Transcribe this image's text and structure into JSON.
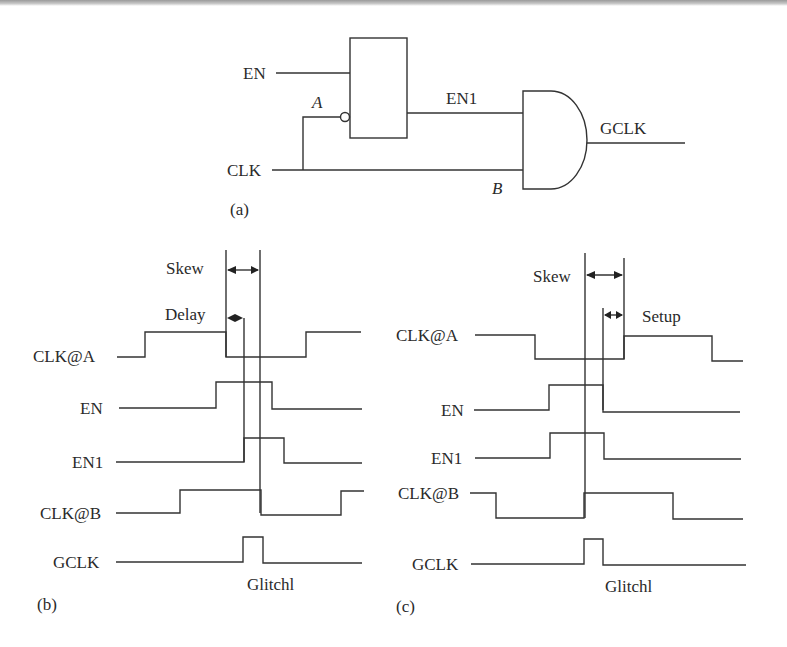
{
  "panel_a": {
    "caption": "(a)",
    "labels": {
      "en": "EN",
      "clk": "CLK",
      "en1": "EN1",
      "gclk": "GCLK",
      "node_a": "A",
      "node_b": "B"
    },
    "components": [
      "latch (active-low clock input)",
      "AND gate"
    ]
  },
  "panel_b": {
    "caption": "(b)",
    "signals": [
      "CLK@A",
      "EN",
      "EN1",
      "CLK@B",
      "GCLK"
    ],
    "annotations": {
      "skew": "Skew",
      "delay": "Delay",
      "glitch": "Glitchl"
    }
  },
  "panel_c": {
    "caption": "(c)",
    "signals": [
      "CLK@A",
      "EN",
      "EN1",
      "CLK@B",
      "GCLK"
    ],
    "annotations": {
      "skew": "Skew",
      "setup": "Setup",
      "glitch": "Glitchl"
    }
  },
  "colors": {
    "line": "#333333",
    "text": "#2a2a2a",
    "background": "#ffffff"
  }
}
